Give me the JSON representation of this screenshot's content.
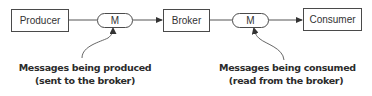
{
  "diagram": {
    "nodes": {
      "producer": "Producer",
      "broker": "Broker",
      "consumer": "Consumer"
    },
    "messages": {
      "produced": "M",
      "consumed": "M"
    },
    "captions": {
      "produced": {
        "line1": "Messages being produced",
        "line2": "(sent to the broker)"
      },
      "consumed": {
        "line1": "Messages being consumed",
        "line2": "(read from the broker)"
      }
    },
    "colors": {
      "stroke": "#4a4a4a",
      "text": "#333333",
      "caption": "#2b2b2b",
      "background": "#ffffff"
    }
  }
}
